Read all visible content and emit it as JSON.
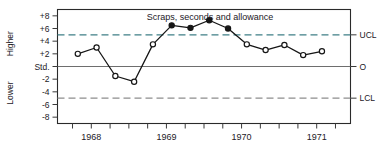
{
  "chart_data": {
    "type": "line",
    "title": "Scraps, seconds and allowance",
    "xlabel": "",
    "ylabel": "",
    "ylim": [
      -9,
      9
    ],
    "xlim": [
      1967.55,
      1971.45
    ],
    "grid": false,
    "legend": "none",
    "y_ticks": [
      {
        "value": 8,
        "label": "+8"
      },
      {
        "value": 6,
        "label": "+6"
      },
      {
        "value": 4,
        "label": "+4"
      },
      {
        "value": 2,
        "label": "+2"
      },
      {
        "value": 0,
        "label": "Std."
      },
      {
        "value": -2,
        "label": "-2"
      },
      {
        "value": -4,
        "label": "-4"
      },
      {
        "value": -6,
        "label": "-6"
      },
      {
        "value": -8,
        "label": "-8"
      }
    ],
    "x_ticks": [
      {
        "value": 1967.75,
        "label": ""
      },
      {
        "value": 1968.0,
        "label": "1968"
      },
      {
        "value": 1968.25,
        "label": ""
      },
      {
        "value": 1968.5,
        "label": ""
      },
      {
        "value": 1968.75,
        "label": ""
      },
      {
        "value": 1969.0,
        "label": "1969"
      },
      {
        "value": 1969.25,
        "label": ""
      },
      {
        "value": 1969.5,
        "label": ""
      },
      {
        "value": 1969.75,
        "label": ""
      },
      {
        "value": 1970.0,
        "label": "1970"
      },
      {
        "value": 1970.25,
        "label": ""
      },
      {
        "value": 1970.5,
        "label": ""
      },
      {
        "value": 1970.75,
        "label": ""
      },
      {
        "value": 1971.0,
        "label": "1971"
      },
      {
        "value": 1971.25,
        "label": ""
      }
    ],
    "reference_lines": [
      {
        "name": "UCL",
        "value": 5,
        "label": "UCL",
        "style": "dashed",
        "color": "#3f7f86"
      },
      {
        "name": "Std",
        "value": 0,
        "label": "O",
        "style": "solid",
        "color": "#6e6e6e"
      },
      {
        "name": "LCL",
        "value": -5,
        "label": "LCL",
        "style": "dashed",
        "color": "#8d8d8d"
      }
    ],
    "side_labels": {
      "upper": "Higher",
      "lower": "Lower"
    },
    "series": [
      {
        "name": "Scraps, seconds and allowance",
        "color": "#161616",
        "x": [
          1967.82,
          1968.07,
          1968.32,
          1968.57,
          1968.82,
          1969.07,
          1969.32,
          1969.57,
          1969.82,
          1970.07,
          1970.32,
          1970.57,
          1970.82,
          1971.07
        ],
        "values": [
          2.0,
          3.0,
          -1.5,
          -2.4,
          3.5,
          6.5,
          6.1,
          7.3,
          6.0,
          3.5,
          2.6,
          3.4,
          1.8,
          2.4
        ],
        "marker_filled": [
          false,
          false,
          false,
          false,
          false,
          true,
          true,
          true,
          true,
          false,
          false,
          false,
          false,
          false
        ]
      }
    ]
  }
}
